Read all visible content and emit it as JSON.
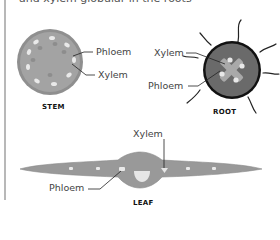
{
  "header": {
    "clipped_text": "and xylem globular in the roots"
  },
  "colors": {
    "tissue_fill": "#999999",
    "tissue_border": "#808080",
    "root_fill": "#6a6a6a",
    "root_border": "#111111",
    "vascular_light": "#e6e6e6",
    "xylem_cross": "#a8a8a8",
    "leader_line": "#222222",
    "rule": "#b8b8b8"
  },
  "diagrams": {
    "stem": {
      "caption": "STEM",
      "labels": {
        "phloem": "Phloem",
        "xylem": "Xylem"
      }
    },
    "root": {
      "caption": "ROOT",
      "labels": {
        "xylem": "Xylem",
        "phloem": "Phloem"
      }
    },
    "leaf": {
      "caption": "LEAF",
      "labels": {
        "xylem": "Xylem",
        "phloem": "Phloem"
      }
    }
  }
}
